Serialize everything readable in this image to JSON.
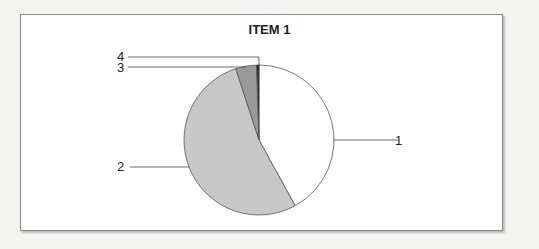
{
  "chart_data": {
    "type": "pie",
    "title": "ITEM 1",
    "categories": [
      "1",
      "2",
      "3",
      "4"
    ],
    "values": [
      42,
      53,
      4.5,
      0.5
    ],
    "colors": [
      "#ffffff",
      "#c8c8c8",
      "#9a9a9a",
      "#222222"
    ],
    "legend": "none; leader-line labels",
    "start_angle": "12 o'clock, clockwise"
  },
  "labels": {
    "l1": "1",
    "l2": "2",
    "l3": "3",
    "l4": "4"
  }
}
